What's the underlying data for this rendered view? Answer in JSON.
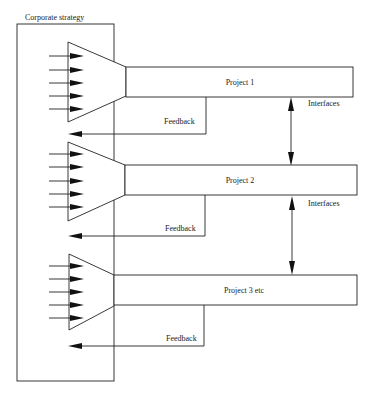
{
  "diagram": {
    "title": "Corporate strategy",
    "colors": {
      "line": "#222222",
      "background": "#ffffff"
    },
    "projects": [
      {
        "label": "Project 1",
        "feedback_label": "Feedback",
        "inputs": 5
      },
      {
        "label": "Project 2",
        "feedback_label": "Feedback",
        "inputs": 5
      },
      {
        "label": "Project 3 etc",
        "feedback_label": "Feedback",
        "inputs": 5
      }
    ],
    "interfaces": [
      {
        "label": "Interfaces",
        "between": [
          "Project 1",
          "Project 2"
        ]
      },
      {
        "label": "Interfaces",
        "between": [
          "Project 2",
          "Project 3 etc"
        ]
      }
    ]
  }
}
